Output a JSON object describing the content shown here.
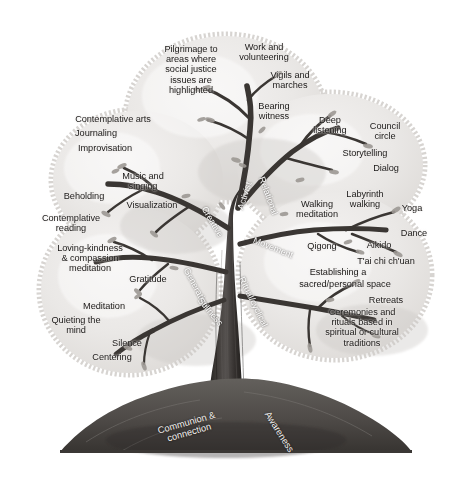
{
  "figure": {
    "kind": "tree-of-contemplative-practices",
    "palette": {
      "background": "#ffffff",
      "canopy_fill": "#e9e7e5",
      "canopy_fill_light": "#f1efed",
      "canopy_edge": "#cfccc9",
      "trunk_dark": "#2e2b29",
      "trunk_mid": "#474340",
      "branch": "#3d3936",
      "leaf": "#9b9792",
      "ground": "#56524f",
      "ground_dark": "#3b3836",
      "text": "#1c1a19",
      "text_on_trunk": "#ffffff"
    }
  },
  "branches": [
    {
      "name": "Activist",
      "x": 245,
      "y": 196,
      "rotate": -72
    },
    {
      "name": "Relational",
      "x": 268,
      "y": 196,
      "rotate": 70
    },
    {
      "name": "Creative",
      "x": 212,
      "y": 222,
      "rotate": 60
    },
    {
      "name": "Movement",
      "x": 273,
      "y": 248,
      "rotate": 22
    },
    {
      "name": "Generative",
      "x": 196,
      "y": 288,
      "rotate": 62
    },
    {
      "name": "Stillness",
      "x": 210,
      "y": 312,
      "rotate": 50
    },
    {
      "name": "Ritual/cyclical",
      "x": 253,
      "y": 302,
      "rotate": 64
    }
  ],
  "roots": [
    {
      "name": "Communion &\nconnection",
      "x": 188,
      "y": 428,
      "rotate": -16
    },
    {
      "name": "Awareness",
      "x": 279,
      "y": 432,
      "rotate": 58
    }
  ],
  "clusters": [
    {
      "id": "activist",
      "label": "Activist",
      "practices": [
        {
          "text": "Pilgrimage to\nareas where\nsocial justice\nissues are\nhighlighted",
          "x": 191,
          "y": 70,
          "align": "center"
        },
        {
          "text": "Work and\nvolunteering",
          "x": 264,
          "y": 52,
          "align": "center"
        },
        {
          "text": "Vigils and\nmarches",
          "x": 290,
          "y": 80,
          "align": "center"
        },
        {
          "text": "Bearing\nwitness",
          "x": 274,
          "y": 111,
          "align": "center"
        }
      ]
    },
    {
      "id": "relational",
      "label": "Relational",
      "practices": [
        {
          "text": "Deep\nlistening",
          "x": 330,
          "y": 125,
          "align": "center"
        },
        {
          "text": "Council\ncircle",
          "x": 385,
          "y": 131,
          "align": "center"
        },
        {
          "text": "Storytelling",
          "x": 365,
          "y": 153,
          "align": "center"
        },
        {
          "text": "Dialog",
          "x": 386,
          "y": 168,
          "align": "center"
        }
      ]
    },
    {
      "id": "creative",
      "label": "Creative",
      "practices": [
        {
          "text": "Contemplative arts",
          "x": 113,
          "y": 119,
          "align": "center"
        },
        {
          "text": "Journaling",
          "x": 96,
          "y": 133,
          "align": "center"
        },
        {
          "text": "Improvisation",
          "x": 105,
          "y": 148,
          "align": "center"
        },
        {
          "text": "Music and\nsinging",
          "x": 143,
          "y": 181,
          "align": "center"
        },
        {
          "text": "Visualization",
          "x": 152,
          "y": 205,
          "align": "center"
        },
        {
          "text": "Beholding",
          "x": 84,
          "y": 196,
          "align": "center"
        }
      ]
    },
    {
      "id": "movement",
      "label": "Movement",
      "practices": [
        {
          "text": "Walking\nmeditation",
          "x": 317,
          "y": 209,
          "align": "center"
        },
        {
          "text": "Labyrinth\nwalking",
          "x": 365,
          "y": 199,
          "align": "center"
        },
        {
          "text": "Yoga",
          "x": 412,
          "y": 208,
          "align": "center"
        },
        {
          "text": "Dance",
          "x": 414,
          "y": 233,
          "align": "center"
        },
        {
          "text": "Qigong",
          "x": 322,
          "y": 246,
          "align": "center"
        },
        {
          "text": "Aikido",
          "x": 379,
          "y": 245,
          "align": "center"
        },
        {
          "text": "T'ai chi ch'uan",
          "x": 386,
          "y": 261,
          "align": "center"
        }
      ]
    },
    {
      "id": "generative",
      "label": "Generative",
      "practices": [
        {
          "text": "Contemplative\nreading",
          "x": 71,
          "y": 223,
          "align": "center"
        },
        {
          "text": "Loving-kindness\n& compassion\nmeditation",
          "x": 90,
          "y": 258,
          "align": "center"
        },
        {
          "text": "Gratitude",
          "x": 148,
          "y": 279,
          "align": "center"
        }
      ]
    },
    {
      "id": "stillness",
      "label": "Stillness",
      "practices": [
        {
          "text": "Meditation",
          "x": 104,
          "y": 306,
          "align": "center"
        },
        {
          "text": "Quieting the\nmind",
          "x": 76,
          "y": 325,
          "align": "center"
        },
        {
          "text": "Silence",
          "x": 127,
          "y": 343,
          "align": "center"
        },
        {
          "text": "Centering",
          "x": 112,
          "y": 357,
          "align": "center"
        }
      ]
    },
    {
      "id": "ritual-cyclical",
      "label": "Ritual/cyclical",
      "practices": [
        {
          "text": "Establishing a",
          "x": 338,
          "y": 272,
          "align": "center"
        },
        {
          "text": "sacred/personal space",
          "x": 345,
          "y": 284,
          "align": "center"
        },
        {
          "text": "Retreats",
          "x": 386,
          "y": 300,
          "align": "center"
        },
        {
          "text": "Ceremonies and\nrituals based in\nspiritual or cultural\ntraditions",
          "x": 362,
          "y": 327,
          "align": "center"
        }
      ]
    }
  ]
}
